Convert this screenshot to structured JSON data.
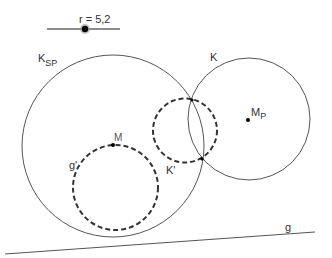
{
  "slider": {
    "variable": "r",
    "label": "r = 5,2",
    "value": 5.2
  },
  "labels": {
    "circle_ksp": {
      "main": "K",
      "sub": "SP"
    },
    "circle_k": "K",
    "point_mp": {
      "main": "M",
      "sub": "P"
    },
    "point_m": "M",
    "circle_g_prime": "g'",
    "circle_k_prime": "K'",
    "line_g": "g"
  },
  "colors": {
    "stroke": "#555555",
    "dashed_stroke": "#333333",
    "point": "#000000",
    "text": "#333333"
  }
}
